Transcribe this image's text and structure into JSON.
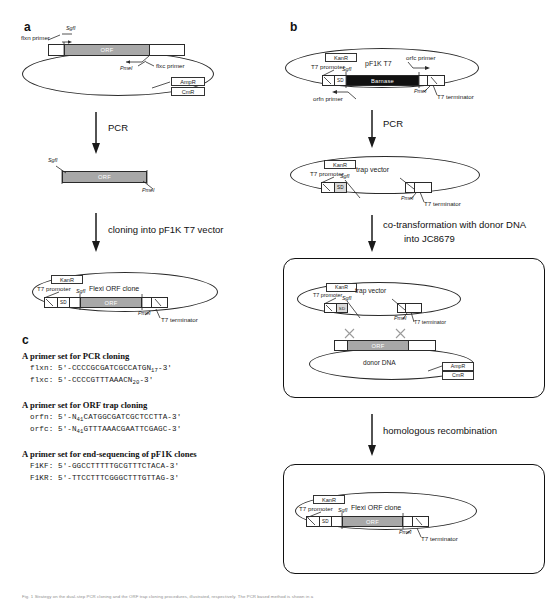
{
  "figure": {
    "panels": [
      "a",
      "b",
      "c"
    ],
    "caption": "Fig. 1 Strategy on the dual-step PCR cloning and the ORF trap cloning procedures, illustrated, respectively. The PCR based method is shown in a"
  },
  "panel_a": {
    "letter": "a",
    "top_plasmid": {
      "primer_left": "flxn primer",
      "primer_right": "flxc primer",
      "site_left": "SgfI",
      "site_right": "PmeI",
      "orf_label": "ORF",
      "marker_1": "AmpR",
      "marker_2": "CmR"
    },
    "step_1": "PCR",
    "fragment": {
      "site_left": "SgfI",
      "site_right": "PmeI",
      "orf_label": "ORF"
    },
    "step_2": "cloning into pF1K T7 vector",
    "bottom_plasmid": {
      "title": "Flexi ORF clone",
      "marker": "KanR",
      "promoter": "T7 promoter",
      "sd": "SD",
      "site_left": "SgfI",
      "orf_label": "ORF",
      "site_right": "PmeI",
      "terminator": "T7 terminator"
    }
  },
  "panel_b": {
    "letter": "b",
    "top_plasmid": {
      "title": "pF1K T7",
      "marker": "KanR",
      "promoter": "T7 promoter",
      "sd": "SD",
      "site_left": "SgfI",
      "gene_label": "Barnase",
      "site_right": "PmeI",
      "terminator": "T7 terminator",
      "primer_left": "orfn primer",
      "primer_right": "orfc primer"
    },
    "step_1": "PCR",
    "trap_plasmid": {
      "title": "trap vector",
      "marker": "KanR",
      "promoter": "T7 promoter",
      "sd": "SD",
      "site_left": "SgfI",
      "site_right": "PmeI",
      "terminator": "T7 terminator"
    },
    "step_2_line_1": "co-transformation with donor DNA",
    "step_2_line_2": "into JC8679",
    "recombination_box": {
      "trap_title": "trap vector",
      "trap_marker": "KanR",
      "trap_promoter": "T7 promoter",
      "trap_sd": "SD",
      "trap_site_left": "SgfI",
      "trap_site_right": "PmeI",
      "trap_terminator": "T7 terminator",
      "donor_title": "donor DNA",
      "donor_orf": "ORF",
      "donor_marker_1": "AmpR",
      "donor_marker_2": "CmR"
    },
    "step_3": "homologous recombination",
    "result_box": {
      "title": "Flexi ORF clone",
      "marker": "KanR",
      "promoter": "T7 promoter",
      "sd": "SD",
      "site_left": "SgfI",
      "orf_label": "ORF",
      "site_right": "PmeI",
      "terminator": "T7 terminator"
    }
  },
  "panel_c": {
    "letter": "c",
    "groups": [
      {
        "heading": "A primer set for PCR cloning",
        "primers": [
          {
            "name": "flxn:",
            "seq_pre": "5′-CCCCGCGATCGCCATGN",
            "sub": "17",
            "seq_post": "-3′"
          },
          {
            "name": "flxc:",
            "seq_pre": "5′-CCCCGTTTAAACN",
            "sub": "20",
            "seq_post": "-3′"
          }
        ]
      },
      {
        "heading": "A primer set for ORF trap cloning",
        "primers": [
          {
            "name": "orfn:",
            "seq_pre": "5′-N",
            "sub": "41",
            "seq_post": "CATGGCGATCGCTCCTTA-3′"
          },
          {
            "name": "orfc:",
            "seq_pre": "5′-N",
            "sub": "41",
            "seq_post": "GTTTAAACGAATTCGAGC-3′"
          }
        ]
      },
      {
        "heading": "A primer set for end-sequencing of pF1K clones",
        "primers": [
          {
            "name": "F1KF:",
            "seq_pre": "5′-GGCCTTTTTGCGTTTCTACA-3′",
            "sub": "",
            "seq_post": ""
          },
          {
            "name": "F1KR:",
            "seq_pre": "5′-TTCCTTTCGGGCTTTGTTAG-3′",
            "sub": "",
            "seq_post": ""
          }
        ]
      }
    ]
  }
}
